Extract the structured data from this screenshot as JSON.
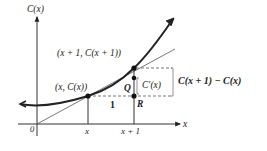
{
  "diagram": {
    "axes": {
      "y_label": "C(x)",
      "x_label": "x",
      "origin_label": "0"
    },
    "ticks": {
      "x": "x",
      "x_plus_1": "x + 1"
    },
    "points": {
      "p1_label": "(x, C(x))",
      "p2_label": "(x + 1, C(x + 1))",
      "q_label": "Q",
      "r_label": "R"
    },
    "annotations": {
      "run_label": "1",
      "tangent_rise_label": "C′(x)",
      "secant_rise_label": "C(x + 1) − C(x)"
    },
    "colors": {
      "curve": "#222222",
      "axis": "#333333",
      "tangent": "#555555",
      "dashed": "#555555",
      "background": "#ffffff"
    }
  }
}
